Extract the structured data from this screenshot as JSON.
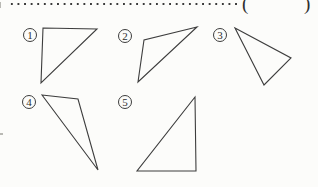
{
  "page": {
    "background": "#fcfcfa",
    "line_color": "#3d3d3d",
    "text_color": "#2e2e2e"
  },
  "answer_line": {
    "leader_style": "dotted",
    "open_paren": "(",
    "close_paren": ")"
  },
  "figures": [
    {
      "label": "1",
      "circle": {
        "x": 23,
        "y": 28
      },
      "points": "43,28 97,29 41,83"
    },
    {
      "label": "2",
      "circle": {
        "x": 118,
        "y": 29
      },
      "points": "197,27 144,40 138,82"
    },
    {
      "label": "3",
      "circle": {
        "x": 213,
        "y": 28
      },
      "points": "235,28 291,58 264,85"
    },
    {
      "label": "4",
      "circle": {
        "x": 22,
        "y": 95
      },
      "points": "42,95 78,99 98,170"
    },
    {
      "label": "5",
      "circle": {
        "x": 118,
        "y": 95
      },
      "points": "195,97 196,171 137,171"
    }
  ]
}
